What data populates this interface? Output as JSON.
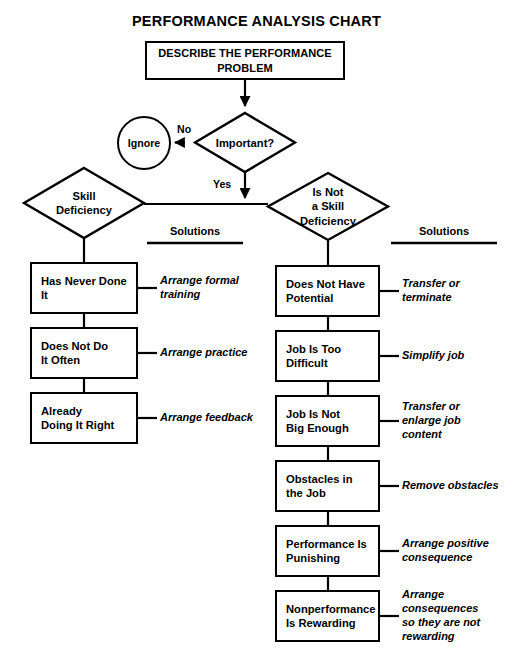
{
  "title": "PERFORMANCE ANALYSIS CHART",
  "start": {
    "label": "DESCRIBE THE PERFORMANCE\nPROBLEM"
  },
  "decision": {
    "label": "Important?",
    "no_label": "No",
    "yes_label": "Yes",
    "ignore_label": "Ignore"
  },
  "branches": {
    "skill": {
      "diamond_label": "Skill\nDeficiency",
      "solutions_header": "Solutions",
      "steps": [
        {
          "cause": "Has Never Done\nIt",
          "solution": "Arrange formal\ntraining"
        },
        {
          "cause": "Does Not Do\nIt Often",
          "solution": "Arrange practice"
        },
        {
          "cause": "Already\nDoing It Right",
          "solution": "Arrange feedback"
        }
      ]
    },
    "not_skill": {
      "diamond_label": "Is Not\na Skill\nDeficiency",
      "solutions_header": "Solutions",
      "steps": [
        {
          "cause": "Does Not Have\nPotential",
          "solution": "Transfer or\nterminate"
        },
        {
          "cause": "Job Is Too\nDifficult",
          "solution": "Simplify job"
        },
        {
          "cause": "Job Is Not\nBig Enough",
          "solution": "Transfer or\nenlarge job\ncontent"
        },
        {
          "cause": "Obstacles in\nthe Job",
          "solution": "Remove obstacles"
        },
        {
          "cause": "Performance Is\nPunishing",
          "solution": "Arrange positive\nconsequence"
        },
        {
          "cause": "Nonperformance\nIs Rewarding",
          "solution": "Arrange\nconsequences\nso they are not\nrewarding"
        }
      ]
    }
  },
  "colors": {
    "ink": "#000000",
    "paper": "#ffffff"
  }
}
